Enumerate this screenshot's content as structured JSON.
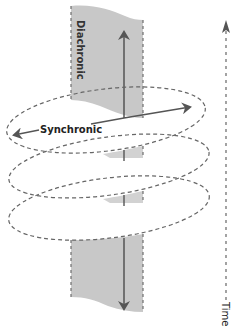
{
  "diagram": {
    "labels": {
      "diachronic": "Diachronic",
      "synchronic": "Synchronic",
      "time": "Time"
    },
    "colors": {
      "panel_fill": "#c8c8c8",
      "panel_edge": "#6e6e6e",
      "arrow": "#555555",
      "ellipse_dash": "#666666",
      "text": "#222222",
      "background": "#ffffff"
    },
    "elements": {
      "panel_top": "Diachronic plane (upper section)",
      "panel_bottom": "Diachronic plane (lower section)",
      "ellipses": [
        "Synchronic slice 1",
        "Synchronic slice 2",
        "Synchronic slice 3"
      ],
      "arrows": [
        "diachronic-up",
        "diachronic-down",
        "synchronic-left",
        "synchronic-right",
        "time-axis"
      ]
    }
  }
}
